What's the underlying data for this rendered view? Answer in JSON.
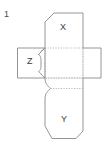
{
  "figure": {
    "problem_number": "1",
    "type": "cube-net-diagram",
    "stroke_color": "#8a8a8a",
    "fold_line_color": "#a8a8a8",
    "background_color": "#ffffff",
    "text_color": "#3a3a3a",
    "labels": {
      "top_face": "X",
      "left_face": "Z",
      "bottom_face": "Y"
    },
    "faces": [
      {
        "name": "top-flap",
        "label": "X"
      },
      {
        "name": "left-flap",
        "label": "Z"
      },
      {
        "name": "center-face",
        "label": ""
      },
      {
        "name": "right-flap",
        "label": ""
      },
      {
        "name": "bottom-flap",
        "label": "Y"
      }
    ]
  }
}
